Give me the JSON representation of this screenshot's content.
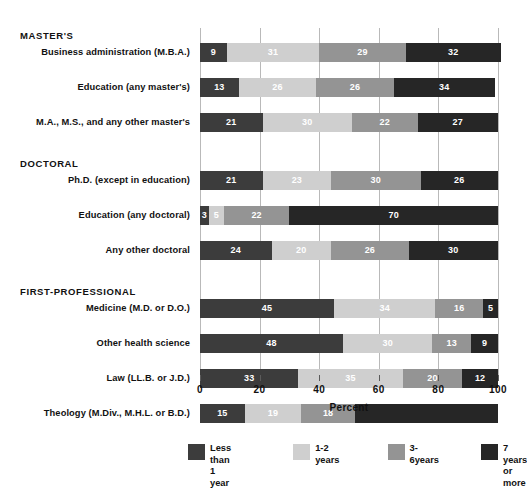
{
  "chart_data": {
    "type": "bar",
    "orientation": "horizontal",
    "stacked": true,
    "title": "",
    "xlabel": "Percent",
    "ylabel": "",
    "xlim": [
      0,
      100
    ],
    "xticks": [
      "0",
      "20",
      "40",
      "60",
      "80",
      "100"
    ],
    "grid": true,
    "legend_position": "bottom",
    "series": [
      {
        "name": "Less than 1 year",
        "color": "#3c3c3c"
      },
      {
        "name": "1-2 years",
        "color": "#cfcfcf"
      },
      {
        "name": "3-6years",
        "color": "#949494"
      },
      {
        "name": "7 years or more",
        "color": "#262626"
      }
    ],
    "groups": [
      {
        "heading": "MASTER'S",
        "categories": [
          {
            "label": "Business administration (M.B.A.)",
            "values": [
              9,
              31,
              29,
              32
            ],
            "labels": [
              "9",
              "31",
              "29",
              "32"
            ]
          },
          {
            "label": "Education (any master's)",
            "values": [
              13,
              26,
              26,
              34
            ],
            "labels": [
              "13",
              "26",
              "26",
              "34"
            ]
          },
          {
            "label": "M.A., M.S., and any other master's",
            "values": [
              21,
              30,
              22,
              27
            ],
            "labels": [
              "21",
              "30",
              "22",
              "27"
            ]
          }
        ]
      },
      {
        "heading": "DOCTORAL",
        "categories": [
          {
            "label": "Ph.D. (except in education)",
            "values": [
              21,
              23,
              30,
              26
            ],
            "labels": [
              "21",
              "23",
              "30",
              "26"
            ]
          },
          {
            "label": "Education (any doctoral)",
            "values": [
              3,
              5,
              22,
              70
            ],
            "labels": [
              "3",
              "5",
              "22",
              "70"
            ]
          },
          {
            "label": "Any other doctoral",
            "values": [
              24,
              20,
              26,
              30
            ],
            "labels": [
              "24",
              "20",
              "26",
              "30"
            ]
          }
        ]
      },
      {
        "heading": "FIRST-PROFESSIONAL",
        "categories": [
          {
            "label": "Medicine (M.D. or D.O.)",
            "values": [
              45,
              34,
              16,
              5
            ],
            "labels": [
              "45",
              "34",
              "16",
              "5"
            ]
          },
          {
            "label": "Other health science",
            "values": [
              48,
              30,
              13,
              9
            ],
            "labels": [
              "48",
              "30",
              "13",
              "9"
            ]
          },
          {
            "label": "Law (LL.B. or J.D.)",
            "values": [
              33,
              35,
              20,
              12
            ],
            "labels": [
              "33",
              "35",
              "20",
              "12"
            ]
          },
          {
            "label": "Theology (M.Div., M.H.L. or B.D.)",
            "values": [
              15,
              19,
              18,
              48
            ],
            "labels": [
              "15",
              "19",
              "18",
              ""
            ]
          }
        ]
      }
    ]
  }
}
